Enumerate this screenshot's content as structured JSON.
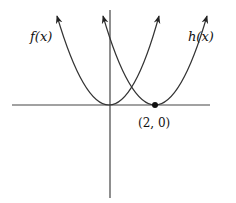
{
  "diagram": {
    "type": "function-graph",
    "colors": {
      "background": "#ffffff",
      "stroke": "#333333",
      "point": "#111111"
    },
    "axes": {
      "x_axis": true,
      "y_axis": true,
      "tick_labels": false
    },
    "curves": [
      {
        "name": "f",
        "label": "f(x)",
        "vertex": [
          0,
          0
        ],
        "shape": "parabola opening up",
        "arrows_on_both_ends": true
      },
      {
        "name": "h",
        "label": "h(x)",
        "vertex": [
          2,
          0
        ],
        "shape": "parabola opening up",
        "arrows_on_both_ends": true
      }
    ],
    "points": [
      {
        "label": "(2, 0)",
        "x": 2,
        "y": 0,
        "filled": true
      }
    ]
  },
  "labels": {
    "f": "f(x)",
    "h": "h(x)",
    "point": "(2, 0)"
  }
}
